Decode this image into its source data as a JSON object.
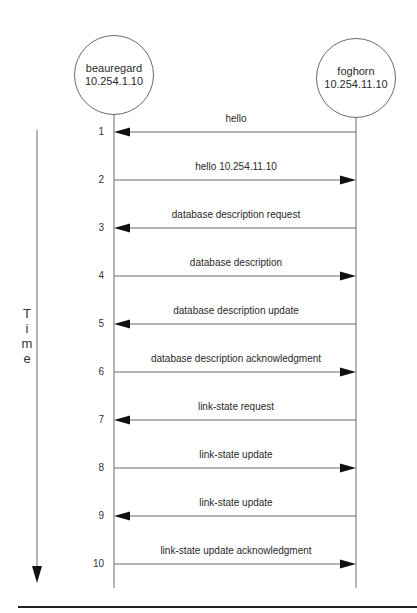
{
  "nodes": {
    "left": {
      "name": "beauregard",
      "ip": "10.254.1.10"
    },
    "right": {
      "name": "foghorn",
      "ip": "10.254.11.10"
    }
  },
  "time_axis": {
    "label_chars": [
      "T",
      "i",
      "m",
      "e"
    ]
  },
  "messages": [
    {
      "step": "1",
      "label": "hello",
      "direction": "right-to-left"
    },
    {
      "step": "2",
      "label": "hello 10.254.11.10",
      "direction": "left-to-right"
    },
    {
      "step": "3",
      "label": "database description request",
      "direction": "right-to-left"
    },
    {
      "step": "4",
      "label": "database description",
      "direction": "left-to-right"
    },
    {
      "step": "5",
      "label": "database description update",
      "direction": "right-to-left"
    },
    {
      "step": "6",
      "label": "database description acknowledgment",
      "direction": "left-to-right"
    },
    {
      "step": "7",
      "label": "link-state request",
      "direction": "right-to-left"
    },
    {
      "step": "8",
      "label": "link-state update",
      "direction": "left-to-right"
    },
    {
      "step": "9",
      "label": "link-state update",
      "direction": "right-to-left"
    },
    {
      "step": "10",
      "label": "link-state update acknowledgment",
      "direction": "left-to-right"
    }
  ],
  "colors": {
    "line": "#6a6a6a",
    "arrowhead": "#111111",
    "rule": "#222222",
    "text": "#2a2a2a"
  }
}
